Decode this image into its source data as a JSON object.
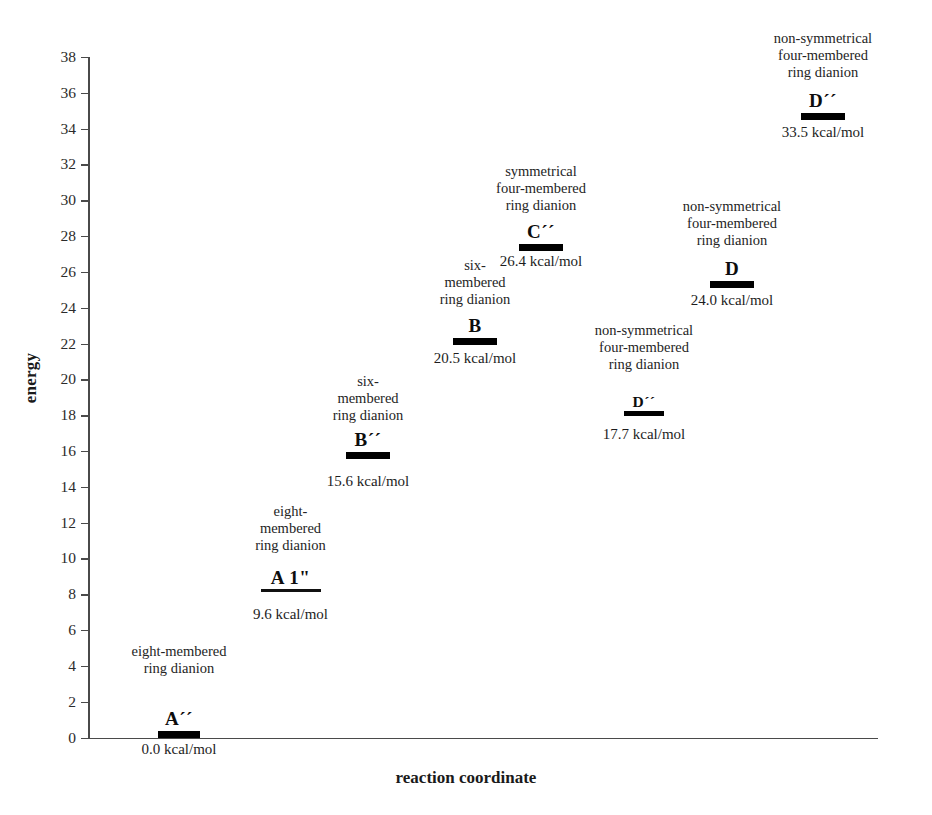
{
  "chart_data": {
    "type": "bar",
    "title": "",
    "xlabel": "reaction coordinate",
    "ylabel": "energy",
    "ylim": [
      0,
      38
    ],
    "ytick_step": 2,
    "yticks": [
      38,
      36,
      34,
      32,
      30,
      28,
      26,
      24,
      22,
      20,
      18,
      16,
      14,
      12,
      10,
      8,
      6,
      4,
      2,
      0
    ],
    "grid": false,
    "legend": "none",
    "units": "kcal/mol",
    "categories": [
      "A´´",
      "A 1\"",
      "B´´",
      "B",
      "D´´",
      "C´´",
      "D",
      "D´´"
    ],
    "values": [
      0.0,
      9.6,
      15.6,
      20.5,
      17.7,
      26.4,
      24.0,
      33.5
    ],
    "annotations": [
      "eight-membered ring dianion",
      "eight-membered ring dianion",
      "six-membered ring dianion",
      "six-membered ring dianion",
      "non-symmetrical four-membered ring dianion",
      "symmetrical four-membered ring dianion",
      "non-symmetrical four-membered ring dianion",
      "non-symmetrical four-membered ring dianion"
    ]
  },
  "axes": {
    "y_title": "energy",
    "x_title": "reaction coordinate",
    "y_ticks": [
      {
        "label": "38",
        "value": 38
      },
      {
        "label": "36",
        "value": 36
      },
      {
        "label": "34",
        "value": 34
      },
      {
        "label": "32",
        "value": 32
      },
      {
        "label": "30",
        "value": 30
      },
      {
        "label": "28",
        "value": 28
      },
      {
        "label": "26",
        "value": 26
      },
      {
        "label": "24",
        "value": 24
      },
      {
        "label": "22",
        "value": 22
      },
      {
        "label": "20",
        "value": 20
      },
      {
        "label": "18",
        "value": 18
      },
      {
        "label": "16",
        "value": 16
      },
      {
        "label": "14",
        "value": 14
      },
      {
        "label": "12",
        "value": 12
      },
      {
        "label": "10",
        "value": 10
      },
      {
        "label": "8",
        "value": 8
      },
      {
        "label": "6",
        "value": 6
      },
      {
        "label": "4",
        "value": 4
      },
      {
        "label": "2",
        "value": 2
      },
      {
        "label": "0",
        "value": 0
      }
    ]
  },
  "levels": [
    {
      "id": "A-double-prime",
      "description": "eight-membered\nring dianion",
      "name": "A´´",
      "value_label": "0.0 kcal/mol",
      "energy": 0.0
    },
    {
      "id": "A-one-prime",
      "description": "eight-\nmembered\nring dianion",
      "name": "A 1\"",
      "value_label": "9.6 kcal/mol",
      "energy": 9.6
    },
    {
      "id": "B-double-prime",
      "description": "six-\nmembered\nring dianion",
      "name": "B´´",
      "value_label": "15.6 kcal/mol",
      "energy": 15.6
    },
    {
      "id": "B",
      "description": "six-\nmembered\nring dianion",
      "name": "B",
      "value_label": "20.5 kcal/mol",
      "energy": 20.5
    },
    {
      "id": "D-double-prime-low",
      "description": "non-symmetrical\nfour-membered\nring dianion",
      "name": "D´´",
      "value_label": "17.7 kcal/mol",
      "energy": 17.7
    },
    {
      "id": "C-double-prime",
      "description": "symmetrical\nfour-membered\nring dianion",
      "name": "C´´",
      "value_label": "26.4 kcal/mol",
      "energy": 26.4
    },
    {
      "id": "D",
      "description": "non-symmetrical\nfour-membered\nring dianion",
      "name": "D",
      "value_label": "24.0 kcal/mol",
      "energy": 24.0
    },
    {
      "id": "D-double-prime-high",
      "description": "non-symmetrical\nfour-membered\nring dianion",
      "name": "D´´",
      "value_label": "33.5 kcal/mol",
      "energy": 33.5
    }
  ]
}
